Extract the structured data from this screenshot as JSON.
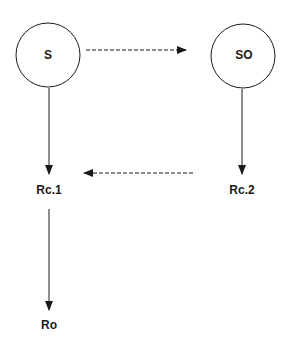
{
  "diagram": {
    "nodes": [
      {
        "id": "S",
        "label": "S",
        "shape": "circle"
      },
      {
        "id": "SO",
        "label": "SO",
        "shape": "circle"
      },
      {
        "id": "Rc1",
        "label": "Rc.1",
        "shape": "text"
      },
      {
        "id": "Rc2",
        "label": "Rc.2",
        "shape": "text"
      },
      {
        "id": "Ro",
        "label": "Ro",
        "shape": "text"
      }
    ],
    "edges": [
      {
        "from": "S",
        "to": "SO",
        "style": "dashed"
      },
      {
        "from": "S",
        "to": "Rc.1",
        "style": "solid"
      },
      {
        "from": "SO",
        "to": "Rc.2",
        "style": "solid"
      },
      {
        "from": "Rc.2",
        "to": "Rc.1",
        "style": "dashed"
      },
      {
        "from": "Rc.1",
        "to": "Ro",
        "style": "solid"
      }
    ],
    "colors": {
      "stroke": "#1a1a1a",
      "background": "#ffffff"
    }
  }
}
